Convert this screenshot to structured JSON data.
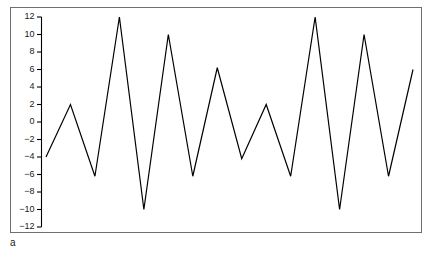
{
  "figure": {
    "panel_label": "a",
    "background_color": "#ffffff",
    "frame_color": "#6f6f6f",
    "line_color": "#000000"
  },
  "chart_data": {
    "type": "line",
    "title": "",
    "xlabel": "",
    "ylabel": "",
    "subtitle": "",
    "grid": false,
    "legend": null,
    "legend_position": "none",
    "x": [
      0,
      1,
      2,
      3,
      4,
      5,
      6,
      7,
      8,
      9,
      10,
      11,
      12,
      13,
      14,
      15
    ],
    "values": [
      -4,
      2,
      -6.2,
      12,
      -10,
      10,
      -6.2,
      6.2,
      -4.2,
      2,
      -6.2,
      12,
      -10,
      10,
      -6.2,
      6
    ],
    "xlim": [
      0,
      15
    ],
    "ylim": [
      -12,
      12
    ],
    "yticks": [
      12,
      10,
      8,
      6,
      4,
      2,
      0,
      -2,
      -4,
      -6,
      -8,
      -10,
      -12
    ],
    "ytick_labels": [
      "12",
      "10",
      "8",
      "6",
      "4",
      "2",
      "0",
      "−2",
      "−4",
      "−6",
      "−8",
      "−10",
      "−12"
    ],
    "xticks": [],
    "xtick_labels": [],
    "series": [
      {
        "name": "series-a",
        "values": [
          -4,
          2,
          -6.2,
          12,
          -10,
          10,
          -6.2,
          6.2,
          -4.2,
          2,
          -6.2,
          12,
          -10,
          10,
          -6.2,
          6
        ]
      }
    ]
  }
}
